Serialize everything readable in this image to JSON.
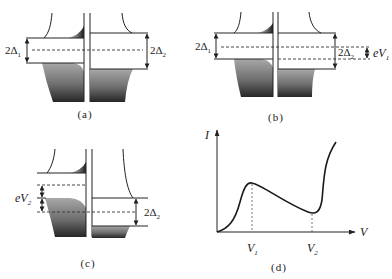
{
  "figure": {
    "panels": {
      "a": {
        "caption": "(a)",
        "left_gap": {
          "main": "2Δ",
          "sub": "1"
        },
        "right_gap": {
          "main": "2Δ",
          "sub": "2"
        }
      },
      "b": {
        "caption": "(b)",
        "left_gap": {
          "main": "2Δ",
          "sub": "1"
        },
        "right_gap": {
          "main": "2Δ",
          "sub": "2"
        },
        "bias": {
          "main": "eV",
          "sub": "1"
        }
      },
      "c": {
        "caption": "(c)",
        "bias": {
          "main": "eV",
          "sub": "2"
        },
        "right_gap": {
          "main": "2Δ",
          "sub": "2"
        }
      },
      "d": {
        "caption": "(d)",
        "y_axis_label": "I",
        "x_axis_label": "V",
        "ticks": [
          {
            "main": "V",
            "sub": "1"
          },
          {
            "main": "V",
            "sub": "2"
          }
        ]
      }
    }
  },
  "colors": {
    "line": "#222222",
    "fill_top": "#a4a4a4",
    "fill_bottom": "#2a2a2a",
    "background": "#ffffff"
  }
}
